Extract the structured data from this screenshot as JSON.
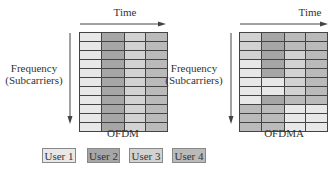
{
  "colors": {
    "user1": "#e8e8e8",
    "user2": "#a6a6a6",
    "user3": "#d2d2d2",
    "user4": "#bababa"
  },
  "left_panel": {
    "time_label": "Time",
    "freq_label_line1": "Frequency",
    "freq_label_line2": "(Subcarriers)",
    "title": "OFDM",
    "cells": [
      [
        "user1",
        "user2",
        "user3",
        "user4"
      ],
      [
        "user1",
        "user2",
        "user3",
        "user4"
      ],
      [
        "user1",
        "user2",
        "user3",
        "user4"
      ],
      [
        "user1",
        "user2",
        "user3",
        "user4"
      ],
      [
        "user1",
        "user2",
        "user3",
        "user4"
      ],
      [
        "user1",
        "user2",
        "user3",
        "user4"
      ],
      [
        "user1",
        "user2",
        "user3",
        "user4"
      ],
      [
        "user1",
        "user2",
        "user3",
        "user4"
      ],
      [
        "user1",
        "user2",
        "user3",
        "user4"
      ],
      [
        "user1",
        "user2",
        "user3",
        "user4"
      ],
      [
        "user1",
        "user2",
        "user3",
        "user4"
      ]
    ]
  },
  "right_panel": {
    "time_label": "Time",
    "freq_label_line1": "Frequency",
    "freq_label_line2": "(Subcarriers)",
    "title": "OFDMA",
    "cells": [
      [
        "user3",
        "user2",
        "user4",
        "user4"
      ],
      [
        "user3",
        "user2",
        "user4",
        "user4"
      ],
      [
        "user3",
        "user2",
        "user3",
        "user4"
      ],
      [
        "user1",
        "user2",
        "user3",
        "user4"
      ],
      [
        "user1",
        "user2",
        "user3",
        "user4"
      ],
      [
        "user1",
        "user1",
        "user3",
        "user4"
      ],
      [
        "user1",
        "user1",
        "user3",
        "user4"
      ],
      [
        "user1",
        "user2",
        "user4",
        "user4"
      ],
      [
        "user4",
        "user4",
        "user1",
        "user1"
      ],
      [
        "user4",
        "user4",
        "user1",
        "user1"
      ],
      [
        "user4",
        "user4",
        "user1",
        "user1"
      ]
    ]
  },
  "legend": [
    {
      "label": "User 1",
      "key": "user1"
    },
    {
      "label": "User 2",
      "key": "user2"
    },
    {
      "label": "User 3",
      "key": "user3"
    },
    {
      "label": "User 4",
      "key": "user4"
    }
  ]
}
